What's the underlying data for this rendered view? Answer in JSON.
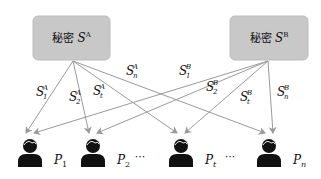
{
  "secrets": [
    {
      "id": "A",
      "label_prefix": "秘密",
      "symbol": "S",
      "superscript": "A",
      "box": {
        "x": 33,
        "y": 16,
        "w": 77,
        "h": 44
      },
      "origin": {
        "x": 73,
        "y": 61
      }
    },
    {
      "id": "B",
      "label_prefix": "秘密",
      "symbol": "S",
      "superscript": "B",
      "box": {
        "x": 230,
        "y": 16,
        "w": 78,
        "h": 44
      },
      "origin": {
        "x": 268,
        "y": 61
      }
    }
  ],
  "participants": [
    {
      "id": "P1",
      "symbol": "P",
      "subscript": "1",
      "cx": 30,
      "label_x": 54
    },
    {
      "id": "P2",
      "symbol": "P",
      "subscript": "2",
      "cx": 93,
      "label_x": 117
    },
    {
      "id": "Pt",
      "symbol": "P",
      "subscript": "t",
      "cx": 181,
      "label_x": 205
    },
    {
      "id": "Pn",
      "symbol": "P",
      "subscript": "n",
      "cx": 269,
      "label_x": 293
    }
  ],
  "ellipses": [
    {
      "text": "···",
      "x": 140,
      "y": 160
    },
    {
      "text": "···",
      "x": 230,
      "y": 160
    }
  ],
  "share_labels": [
    {
      "secret": "A",
      "symbol": "S",
      "subscript": "1",
      "superscript": "A",
      "x": 36,
      "y": 96
    },
    {
      "secret": "A",
      "symbol": "S",
      "subscript": "2",
      "superscript": "A",
      "x": 69,
      "y": 101
    },
    {
      "secret": "A",
      "symbol": "S",
      "subscript": "t",
      "superscript": "A",
      "x": 93,
      "y": 95
    },
    {
      "secret": "A",
      "symbol": "S",
      "subscript": "n",
      "superscript": "A",
      "x": 126,
      "y": 75
    },
    {
      "secret": "B",
      "symbol": "S",
      "subscript": "1",
      "superscript": "B",
      "x": 179,
      "y": 75
    },
    {
      "secret": "B",
      "symbol": "S",
      "subscript": "2",
      "superscript": "B",
      "x": 206,
      "y": 91
    },
    {
      "secret": "B",
      "symbol": "S",
      "subscript": "t",
      "superscript": "B",
      "x": 240,
      "y": 101
    },
    {
      "secret": "B",
      "symbol": "S",
      "subscript": "n",
      "superscript": "B",
      "x": 277,
      "y": 96
    }
  ],
  "colors": {
    "box_fill": "#c8c8c8",
    "box_stroke": "#bdbdbd",
    "arrow": "#9a9a9a",
    "person": "#111111"
  },
  "arrow_target_y": 133
}
